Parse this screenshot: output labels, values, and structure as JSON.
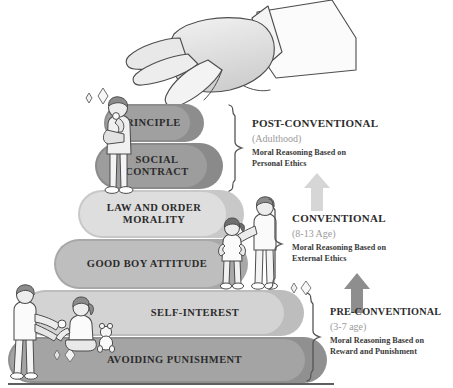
{
  "diagram": {
    "ground_color": "#5e5e5e"
  },
  "stages": [
    {
      "id": "principle",
      "label": "PRINCIPLE",
      "outer_color": "#8d8d8d",
      "inner_color": "#a0a0a0",
      "font_size": 10.5
    },
    {
      "id": "social-contract",
      "label": "SOCIAL\nCONTRACT",
      "outer_color": "#8a8a8a",
      "inner_color": "#9d9d9d",
      "font_size": 10.5
    },
    {
      "id": "law-and-order-morality",
      "label": "LAW AND ORDER\nMORALITY",
      "outer_color": "#c8c8c8",
      "inner_color": "#dcdcdc",
      "font_size": 10.5
    },
    {
      "id": "good-boy-attitude",
      "label": "GOOD BOY ATTITUDE",
      "outer_color": "#a8a8a8",
      "inner_color": "#bcbcbc",
      "font_size": 10.5
    },
    {
      "id": "self-interest",
      "label": "SELF-INTEREST",
      "outer_color": "#bdbdbd",
      "inner_color": "#d2d2d2",
      "font_size": 10.5
    },
    {
      "id": "avoiding-punishment",
      "label": "AVOIDING PUNISHMENT",
      "outer_color": "#909090",
      "inner_color": "#a3a3a3",
      "font_size": 10.5
    }
  ],
  "levels": [
    {
      "id": "post-conventional",
      "title": "POST-CONVENTIONAL",
      "age": "(Adulthood)",
      "description": "Moral Reasoning Based on\nPersonal Ethics",
      "covers": [
        "principle",
        "social-contract"
      ]
    },
    {
      "id": "conventional",
      "title": "CONVENTIONAL",
      "age": "(8-13 Age)",
      "description": "Moral Reasoning Based on\nExternal Ethics",
      "covers": [
        "law-and-order-morality",
        "good-boy-attitude"
      ]
    },
    {
      "id": "pre-conventional",
      "title": "PRE-CONVENTIONAL",
      "age": "(3-7 age)",
      "description": "Moral Reasoning Based on\nReward and Punishment",
      "covers": [
        "self-interest",
        "avoiding-punishment"
      ]
    }
  ],
  "arrows": [
    {
      "id": "arrow-to-post-conventional",
      "direction": "up",
      "color": "#d6d6d6"
    },
    {
      "id": "arrow-to-conventional",
      "direction": "up",
      "color": "#8e8e8e"
    }
  ],
  "illustrations": [
    {
      "id": "reaching-hand",
      "name": "reaching-hand-illustration"
    },
    {
      "id": "adult-thinking",
      "name": "adult-thinking-figure"
    },
    {
      "id": "parent-and-child",
      "name": "parent-and-child-figures"
    },
    {
      "id": "parent-and-toddler",
      "name": "parent-and-toddler-figures"
    },
    {
      "id": "teddy-bear",
      "name": "teddy-bear-illustration"
    }
  ],
  "sparkle_groups": [
    {
      "id": "sparkles-top-left"
    },
    {
      "id": "sparkles-mid-right"
    },
    {
      "id": "sparkles-bottom-left"
    }
  ]
}
